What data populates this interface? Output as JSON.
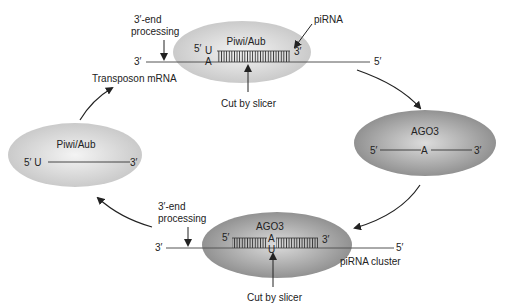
{
  "diagram": {
    "colors": {
      "piwi_fill_center": "#f2f2f2",
      "piwi_fill_edge": "#c9c9c9",
      "ago3_fill_center": "#d8d8d8",
      "ago3_fill_edge": "#8e8e8e",
      "line": "#333333"
    },
    "top_complex": {
      "protein": "Piwi/Aub",
      "five_prime": "5′",
      "base_top": "U",
      "base_bottom": "A",
      "piRNA_3prime": "3′",
      "target_left": "3′",
      "target_right": "5′",
      "processing_label_1": "3′-end",
      "processing_label_2": "processing",
      "piRNA_label": "piRNA",
      "target_label": "Transposon mRNA",
      "cut_label": "Cut by slicer"
    },
    "right_complex": {
      "protein": "AGO3",
      "five_prime": "5′",
      "base": "A",
      "three_prime": "3′"
    },
    "bottom_complex": {
      "protein": "AGO3",
      "five_prime": "5′",
      "base_top": "A",
      "base_bottom": "U",
      "piRNA_3prime": "3′",
      "target_left": "3′",
      "target_right": "5′",
      "processing_label_1": "3′-end",
      "processing_label_2": "processing",
      "target_label": "piRNA cluster",
      "cut_label": "Cut by slicer"
    },
    "left_complex": {
      "protein": "Piwi/Aub",
      "five_prime": "5′ U",
      "three_prime": "3′"
    }
  }
}
